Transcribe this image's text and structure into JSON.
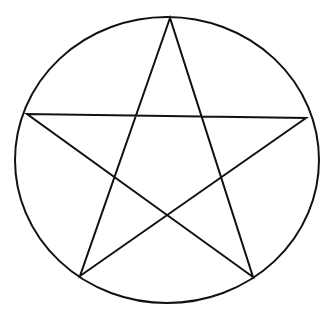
{
  "figure": {
    "name": "pentagram-inscribed-in-circle",
    "viewBox": "0 0 328 322",
    "background_color": "#ffffff",
    "stroke_color": "#111111",
    "stroke_width": 2,
    "circle": {
      "cx": 167,
      "cy": 160,
      "rx": 152,
      "ry": 143
    },
    "star": {
      "vertices": {
        "top": [
          170,
          18
        ],
        "left": [
          27,
          114
        ],
        "right": [
          306,
          118
        ],
        "bottom_left": [
          80,
          276
        ],
        "bottom_right": [
          253,
          277
        ]
      },
      "points": "170,18 80,276 306,118 27,114 253,277"
    }
  }
}
